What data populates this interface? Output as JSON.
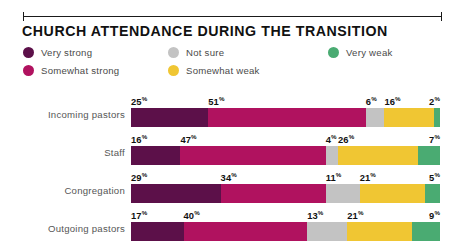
{
  "header": {
    "title": "CHURCH ATTENDANCE DURING THE TRANSITION",
    "rule_icon": "horizontal-rule-with-end-caps"
  },
  "legend": {
    "items": [
      {
        "label": "Very strong",
        "color": "#5c1049",
        "col": 0,
        "row": 0
      },
      {
        "label": "Somewhat strong",
        "color": "#b0125f",
        "col": 0,
        "row": 1
      },
      {
        "label": "Not sure",
        "color": "#c3c3c3",
        "col": 1,
        "row": 0
      },
      {
        "label": "Somewhat weak",
        "color": "#f0c633",
        "col": 1,
        "row": 1
      },
      {
        "label": "Very weak",
        "color": "#4aab72",
        "col": 2,
        "row": 0
      }
    ]
  },
  "chart_data": {
    "type": "bar",
    "orientation": "horizontal",
    "stacked": true,
    "stack_total": 100,
    "unit": "%",
    "title": "CHURCH ATTENDANCE DURING THE TRANSITION",
    "xlabel": "",
    "ylabel": "",
    "xlim": [
      0,
      100
    ],
    "grid": false,
    "legend_position": "top",
    "categories": [
      "Incoming pastors",
      "Staff",
      "Congregation",
      "Outgoing pastors"
    ],
    "series": [
      {
        "name": "Very strong",
        "color": "#5c1049",
        "values": [
          25,
          16,
          29,
          17
        ]
      },
      {
        "name": "Somewhat strong",
        "color": "#b0125f",
        "values": [
          51,
          47,
          34,
          40
        ]
      },
      {
        "name": "Not sure",
        "color": "#c3c3c3",
        "values": [
          6,
          4,
          11,
          13
        ]
      },
      {
        "name": "Somewhat weak",
        "color": "#f0c633",
        "values": [
          16,
          26,
          21,
          21
        ]
      },
      {
        "name": "Very weak",
        "color": "#4aab72",
        "values": [
          2,
          7,
          5,
          9
        ]
      }
    ],
    "rows": [
      {
        "label": "Incoming pastors",
        "segments": [
          {
            "series": "Very strong",
            "value": 25,
            "label": "25",
            "color": "#5c1049"
          },
          {
            "series": "Somewhat strong",
            "value": 51,
            "label": "51",
            "color": "#b0125f"
          },
          {
            "series": "Not sure",
            "value": 6,
            "label": "6",
            "color": "#c3c3c3"
          },
          {
            "series": "Somewhat weak",
            "value": 16,
            "label": "16",
            "color": "#f0c633"
          },
          {
            "series": "Very weak",
            "value": 2,
            "label": "2",
            "color": "#4aab72"
          }
        ]
      },
      {
        "label": "Staff",
        "segments": [
          {
            "series": "Very strong",
            "value": 16,
            "label": "16",
            "color": "#5c1049"
          },
          {
            "series": "Somewhat strong",
            "value": 47,
            "label": "47",
            "color": "#b0125f"
          },
          {
            "series": "Not sure",
            "value": 4,
            "label": "4",
            "color": "#c3c3c3"
          },
          {
            "series": "Somewhat weak",
            "value": 26,
            "label": "26",
            "color": "#f0c633"
          },
          {
            "series": "Very weak",
            "value": 7,
            "label": "7",
            "color": "#4aab72"
          }
        ]
      },
      {
        "label": "Congregation",
        "segments": [
          {
            "series": "Very strong",
            "value": 29,
            "label": "29",
            "color": "#5c1049"
          },
          {
            "series": "Somewhat strong",
            "value": 34,
            "label": "34",
            "color": "#b0125f"
          },
          {
            "series": "Not sure",
            "value": 11,
            "label": "11",
            "color": "#c3c3c3"
          },
          {
            "series": "Somewhat weak",
            "value": 21,
            "label": "21",
            "color": "#f0c633"
          },
          {
            "series": "Very weak",
            "value": 5,
            "label": "5",
            "color": "#4aab72"
          }
        ]
      },
      {
        "label": "Outgoing pastors",
        "segments": [
          {
            "series": "Very strong",
            "value": 17,
            "label": "17",
            "color": "#5c1049"
          },
          {
            "series": "Somewhat strong",
            "value": 40,
            "label": "40",
            "color": "#b0125f"
          },
          {
            "series": "Not sure",
            "value": 13,
            "label": "13",
            "color": "#c3c3c3"
          },
          {
            "series": "Somewhat weak",
            "value": 21,
            "label": "21",
            "color": "#f0c633"
          },
          {
            "series": "Very weak",
            "value": 9,
            "label": "9",
            "color": "#4aab72"
          }
        ]
      }
    ]
  }
}
